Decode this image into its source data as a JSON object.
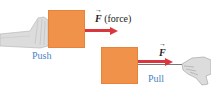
{
  "diagram": {
    "colors": {
      "box": "#f0924a",
      "arrow": "#d9363e",
      "label": "#4a84c4",
      "string": "#777777",
      "hand": "#d8d8d8"
    },
    "push": {
      "label": "Push",
      "force_symbol": "F",
      "force_note": "(force)"
    },
    "pull": {
      "label": "Pull",
      "force_symbol": "F"
    }
  }
}
